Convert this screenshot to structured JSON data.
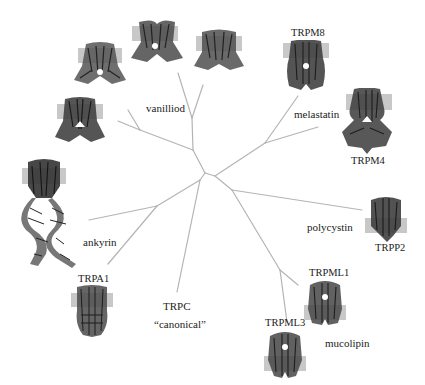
{
  "figure": {
    "colors": {
      "background": "#ffffff",
      "branch": "#b4b4b4",
      "membrane": "#c8c8c8",
      "protein": "#3a3a3a",
      "text": "#222222"
    }
  },
  "subfamilies": [
    {
      "id": "vanilloid",
      "label": "vanilliod"
    },
    {
      "id": "melastatin",
      "label": "melastatin"
    },
    {
      "id": "polycystin",
      "label": "polycystin"
    },
    {
      "id": "mucolipin",
      "label": "mucolipin"
    },
    {
      "id": "canonical",
      "label": "TRPC",
      "sublabel": "“canonical”"
    },
    {
      "id": "ankyrin",
      "label": "ankyrin"
    }
  ],
  "structures": [
    {
      "id": "trpv-a",
      "label": "",
      "family": "vanilloid"
    },
    {
      "id": "trpv-b",
      "label": "",
      "family": "vanilloid"
    },
    {
      "id": "trpv-c",
      "label": "",
      "family": "vanilloid"
    },
    {
      "id": "trpv-d",
      "label": "",
      "family": "vanilloid"
    },
    {
      "id": "trpm8",
      "label": "TRPM8",
      "family": "melastatin"
    },
    {
      "id": "trpm4",
      "label": "TRPM4",
      "family": "melastatin"
    },
    {
      "id": "trpp2",
      "label": "TRPP2",
      "family": "polycystin"
    },
    {
      "id": "trpml1",
      "label": "TRPML1",
      "family": "mucolipin"
    },
    {
      "id": "trpml3",
      "label": "TRPML3",
      "family": "mucolipin"
    },
    {
      "id": "trpa1",
      "label": "TRPA1",
      "family": "ankyrin"
    },
    {
      "id": "trpa-long",
      "label": "",
      "family": "ankyrin"
    }
  ],
  "tree": {
    "branches": [
      [
        205,
        173,
        215,
        176
      ],
      [
        205,
        173,
        193,
        150
      ],
      [
        193,
        150,
        192,
        118
      ],
      [
        192,
        118,
        178,
        73
      ],
      [
        192,
        118,
        203,
        85
      ],
      [
        193,
        150,
        140,
        130
      ],
      [
        140,
        130,
        128,
        110
      ],
      [
        140,
        130,
        118,
        121
      ],
      [
        215,
        176,
        265,
        143
      ],
      [
        265,
        143,
        298,
        96
      ],
      [
        265,
        143,
        318,
        127
      ],
      [
        215,
        176,
        232,
        190
      ],
      [
        232,
        190,
        362,
        210
      ],
      [
        232,
        190,
        280,
        270
      ],
      [
        280,
        270,
        298,
        285
      ],
      [
        280,
        270,
        287,
        322
      ],
      [
        205,
        173,
        200,
        180
      ],
      [
        200,
        180,
        177,
        292
      ],
      [
        200,
        180,
        157,
        206
      ],
      [
        157,
        206,
        89,
        220
      ],
      [
        157,
        206,
        108,
        264
      ]
    ]
  }
}
